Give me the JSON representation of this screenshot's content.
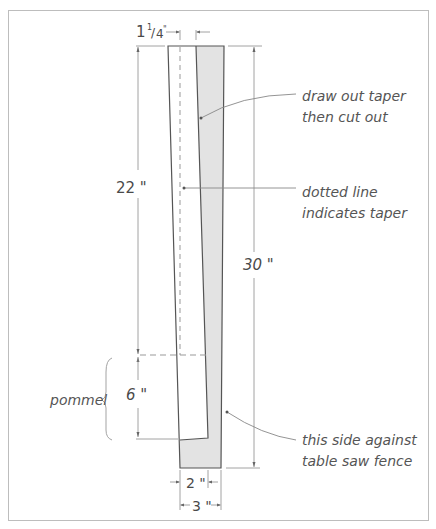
{
  "diagram": {
    "dimensions": {
      "top_offset": "1 1/4\"",
      "top_offset_whole": "1",
      "top_offset_num": "1",
      "top_offset_den": "4",
      "top_offset_inch": "\"",
      "blade_length": "22 \"",
      "pommel_length": "6 \"",
      "total_length": "30 \"",
      "bottom_inner_width": "2 \"",
      "bottom_outer_width": "3 \""
    },
    "labels": {
      "pommel": "pommel"
    },
    "notes": {
      "taper_line1": "draw out taper",
      "taper_line2": "then cut out",
      "dotted_line1": "dotted line",
      "dotted_line2": "indicates taper",
      "fence_line1": "this side against",
      "fence_line2": "table saw fence"
    },
    "colors": {
      "frame": "#bdbdbd",
      "outline": "#555555",
      "shaded": "#e3e3e3",
      "dim_line": "#8a8a8a"
    }
  }
}
